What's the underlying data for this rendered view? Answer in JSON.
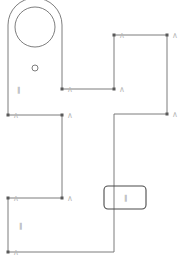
{
  "sketch": {
    "stroke_color": "#6e6e6e",
    "point_color": "#5a5a5a",
    "constraint_color": "#b8b8b8",
    "outline_points": [
      [
        8,
        115
      ],
      [
        8,
        25
      ],
      [
        62,
        25
      ],
      [
        62,
        89
      ],
      [
        114,
        89
      ],
      [
        114,
        35
      ],
      [
        167,
        35
      ],
      [
        167,
        114
      ],
      [
        114,
        114
      ],
      [
        114,
        252
      ],
      [
        8,
        252
      ],
      [
        8,
        198
      ],
      [
        62,
        198
      ],
      [
        62,
        115
      ],
      [
        8,
        115
      ]
    ],
    "arc": {
      "cx": 35,
      "cy": 25,
      "r": 27
    },
    "circles": [
      {
        "cx": 35,
        "cy": 27,
        "r": 20,
        "name": "large-hole"
      },
      {
        "cx": 35,
        "cy": 68,
        "r": 3,
        "name": "small-hole"
      }
    ],
    "vertices": [
      [
        62,
        89
      ],
      [
        114,
        89
      ],
      [
        114,
        35
      ],
      [
        167,
        35
      ],
      [
        167,
        114
      ],
      [
        8,
        115
      ],
      [
        62,
        115
      ],
      [
        8,
        198
      ],
      [
        8,
        252
      ],
      [
        62,
        198
      ]
    ],
    "constraint_glyph": "∧",
    "labels": [
      {
        "x": 17,
        "y": 92,
        "text": "‖"
      },
      {
        "x": 19,
        "y": 228,
        "text": "‖"
      },
      {
        "x": 124,
        "y": 200,
        "text": "‖"
      }
    ],
    "selection_box": {
      "x": 104,
      "y": 186,
      "w": 42,
      "h": 23,
      "rx": 4
    }
  }
}
